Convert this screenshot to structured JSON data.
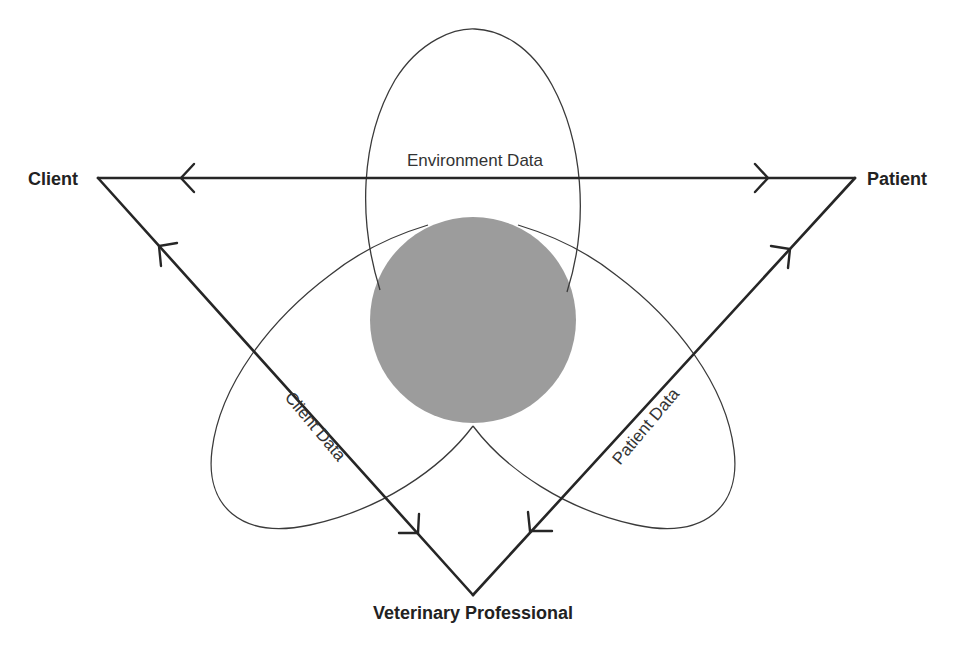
{
  "diagram": {
    "nodes": {
      "client": {
        "label": "Client"
      },
      "patient": {
        "label": "Patient"
      },
      "vet": {
        "label": "Veterinary Professional"
      }
    },
    "petals": {
      "environment": {
        "label": "Environment Data"
      },
      "client": {
        "label": "Client Data"
      },
      "patient": {
        "label": "Patient Data"
      }
    },
    "edges": [
      {
        "from": "Patient",
        "to": "Client",
        "direction": "Patient → Client (arrow near Client)",
        "also": "Client → Patient (arrow near Patient)"
      },
      {
        "from": "Veterinary Professional",
        "to": "Client",
        "direction": "bidirectional"
      },
      {
        "from": "Patient",
        "to": "Veterinary Professional",
        "direction": "bidirectional"
      }
    ],
    "colors": {
      "line": "#262626",
      "core_fill": "#9c9c9c",
      "text": "#222222",
      "background": "#ffffff"
    }
  }
}
